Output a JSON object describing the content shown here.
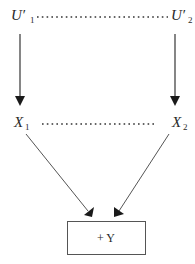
{
  "diagram": {
    "nodes": {
      "u1": {
        "main": "U′",
        "sub": "1"
      },
      "u2": {
        "main": "U′",
        "sub": "2"
      },
      "x1": {
        "main": "X",
        "sub": "1"
      },
      "x2": {
        "main": "X",
        "sub": "2"
      },
      "y": {
        "label": "+ Y"
      }
    },
    "edges": [
      {
        "from": "U′1",
        "to": "X1",
        "style": "solid-arrow"
      },
      {
        "from": "U′2",
        "to": "X2",
        "style": "solid-arrow"
      },
      {
        "from": "X1",
        "to": "Y",
        "style": "solid-arrow"
      },
      {
        "from": "X2",
        "to": "Y",
        "style": "solid-arrow"
      },
      {
        "from": "U′1",
        "to": "U′2",
        "style": "dotted"
      },
      {
        "from": "X1",
        "to": "X2",
        "style": "dotted"
      }
    ]
  }
}
